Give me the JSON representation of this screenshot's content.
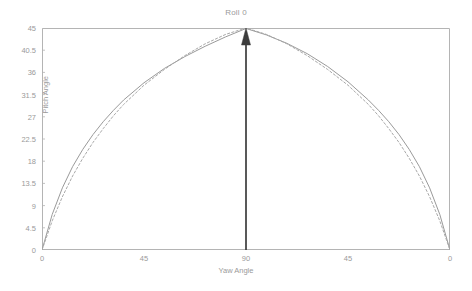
{
  "chart_data": {
    "type": "line",
    "title": "Roll 0",
    "xlabel": "Yaw Angle",
    "ylabel": "Pitch Angle",
    "xlim": [
      0,
      180
    ],
    "ylim": [
      0,
      45
    ],
    "grid": false,
    "legend": "none",
    "xticks": [
      {
        "value": 0,
        "label": "0"
      },
      {
        "value": 45,
        "label": "45"
      },
      {
        "value": 90,
        "label": "90"
      },
      {
        "value": 135,
        "label": "45"
      },
      {
        "value": 180,
        "label": "0"
      }
    ],
    "yticks": [
      {
        "value": 0,
        "label": "0"
      },
      {
        "value": 4.5,
        "label": "4.5"
      },
      {
        "value": 9,
        "label": "9"
      },
      {
        "value": 13.5,
        "label": "13.5"
      },
      {
        "value": 18,
        "label": "18"
      },
      {
        "value": 22.5,
        "label": "22.5"
      },
      {
        "value": 27,
        "label": "27"
      },
      {
        "value": 31.5,
        "label": "31.5"
      },
      {
        "value": 36,
        "label": "36"
      },
      {
        "value": 40.5,
        "label": "40.5"
      },
      {
        "value": 45,
        "label": "45"
      }
    ],
    "colors": {
      "solid_curve": "#9a9a9a",
      "dashed_curve": "#a8a8a8",
      "frame": "#b4b4b4",
      "arrow": "#3c3c3c",
      "text": "#9a9a9a"
    },
    "series": [
      {
        "name": "solid",
        "style": "solid",
        "color": "#9a9a9a",
        "x": [
          0,
          4.5,
          9,
          13.5,
          18,
          22.5,
          27,
          31.5,
          36,
          45,
          54,
          63,
          72,
          81,
          90,
          99,
          108,
          117,
          126,
          135,
          144,
          148.5,
          153,
          157.5,
          162,
          166.5,
          171,
          175.5,
          180
        ],
        "y": [
          0,
          7.2,
          12.6,
          16.9,
          20.4,
          23.4,
          26.0,
          28.3,
          30.4,
          33.9,
          36.8,
          39.2,
          41.3,
          43.2,
          44.9,
          43.6,
          41.9,
          39.8,
          37.2,
          34.1,
          30.4,
          28.3,
          26.0,
          23.4,
          20.4,
          16.9,
          12.6,
          7.2,
          0
        ]
      },
      {
        "name": "dashed",
        "style": "dashed",
        "color": "#a8a8a8",
        "x": [
          0,
          4.5,
          9,
          13.5,
          18,
          22.5,
          27,
          31.5,
          36,
          45,
          54,
          63,
          72,
          81,
          90,
          99,
          108,
          117,
          126,
          135,
          144,
          148.5,
          153,
          157.5,
          162,
          166.5,
          171,
          175.5,
          180
        ],
        "y": [
          0,
          5.9,
          10.8,
          15.0,
          18.6,
          21.8,
          24.6,
          27.2,
          29.5,
          33.4,
          36.6,
          39.4,
          41.8,
          43.7,
          45.0,
          43.7,
          41.8,
          39.4,
          36.6,
          33.4,
          29.5,
          27.2,
          24.6,
          21.8,
          18.6,
          15.0,
          10.8,
          5.9,
          0
        ]
      }
    ],
    "annotations": [
      {
        "kind": "arrow",
        "name": "peak-arrow",
        "from": {
          "x": 90,
          "y": 0
        },
        "to": {
          "x": 90,
          "y": 45
        },
        "color": "#3c3c3c"
      }
    ]
  }
}
